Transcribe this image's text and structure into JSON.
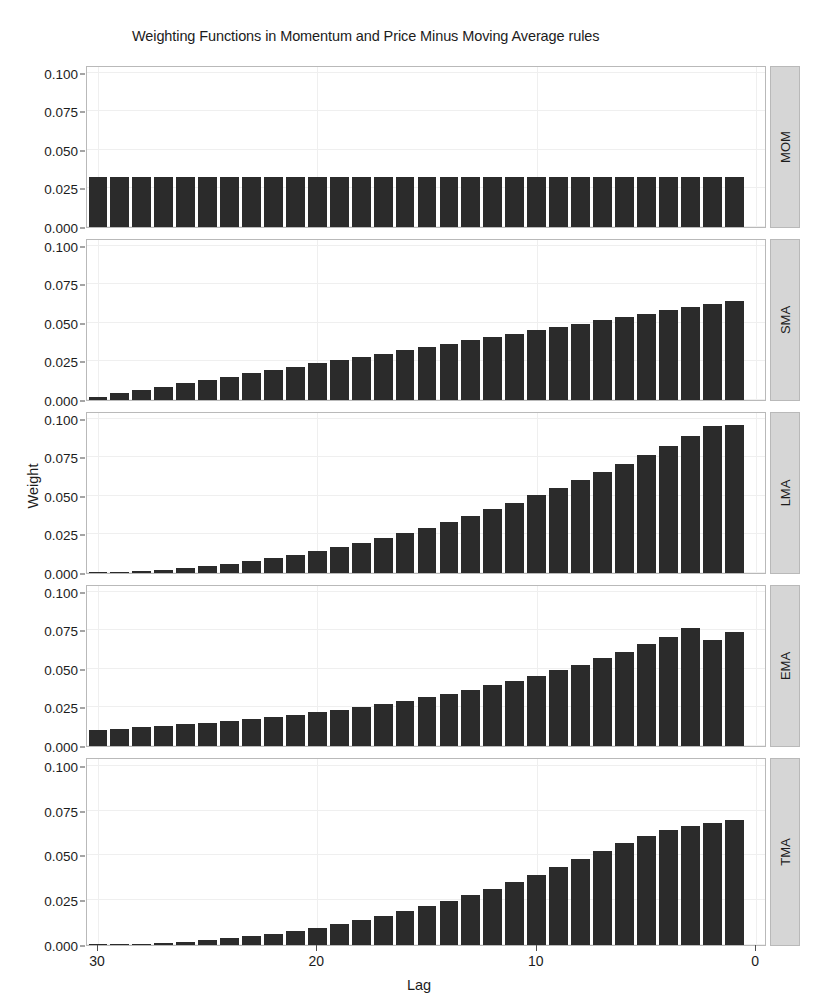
{
  "chart_data": {
    "type": "bar",
    "title": "Weighting Functions in Momentum and Price Minus Moving Average rules",
    "xlabel": "Lag",
    "ylabel": "Weight",
    "x_reversed": true,
    "xlim": [
      30.5,
      -0.5
    ],
    "ylim": [
      0.0,
      0.105
    ],
    "xticks": [
      30,
      20,
      10,
      0
    ],
    "xtick_labels": [
      "30",
      "20",
      "10",
      "0"
    ],
    "yticks": [
      0.0,
      0.025,
      0.05,
      0.075,
      0.1
    ],
    "ytick_labels": [
      "0.000",
      "0.025",
      "0.050",
      "0.075",
      "0.100"
    ],
    "grid": true,
    "legend": "none",
    "facet_position": "right",
    "bar_color": "#2b2b2b",
    "panel_background": "#ffffff",
    "strip_background": "#d6d6d6",
    "gridline_color": "#efefef",
    "lags": [
      30,
      29,
      28,
      27,
      26,
      25,
      24,
      23,
      22,
      21,
      20,
      19,
      18,
      17,
      16,
      15,
      14,
      13,
      12,
      11,
      10,
      9,
      8,
      7,
      6,
      5,
      4,
      3,
      2,
      1
    ],
    "panels": [
      {
        "label": "MOM",
        "values": [
          0.0323,
          0.0323,
          0.0323,
          0.0323,
          0.0323,
          0.0323,
          0.0323,
          0.0323,
          0.0323,
          0.0323,
          0.0323,
          0.0323,
          0.0323,
          0.0323,
          0.0323,
          0.0323,
          0.0323,
          0.0323,
          0.0323,
          0.0323,
          0.0323,
          0.0323,
          0.0323,
          0.0323,
          0.0323,
          0.0323,
          0.0323,
          0.0323,
          0.0323,
          0.0323
        ]
      },
      {
        "label": "SMA",
        "values": [
          0.0022,
          0.0043,
          0.0065,
          0.0086,
          0.0108,
          0.0129,
          0.0151,
          0.0172,
          0.0194,
          0.0215,
          0.0237,
          0.0258,
          0.028,
          0.0301,
          0.0323,
          0.0344,
          0.0366,
          0.0387,
          0.0409,
          0.043,
          0.0452,
          0.0473,
          0.0495,
          0.0516,
          0.0538,
          0.0559,
          0.0581,
          0.0602,
          0.0624,
          0.0645
        ]
      },
      {
        "label": "LMA",
        "values": [
          0.0002,
          0.0006,
          0.0013,
          0.0021,
          0.0032,
          0.0045,
          0.006,
          0.0078,
          0.0097,
          0.0119,
          0.0143,
          0.0169,
          0.0197,
          0.0228,
          0.026,
          0.0295,
          0.0332,
          0.0372,
          0.0413,
          0.0457,
          0.0503,
          0.0551,
          0.0602,
          0.0654,
          0.0709,
          0.0766,
          0.0826,
          0.0887,
          0.0951,
          0.096
        ]
      },
      {
        "label": "EMA",
        "values": [
          0.0104,
          0.0112,
          0.0121,
          0.013,
          0.014,
          0.0151,
          0.0162,
          0.0175,
          0.0188,
          0.0203,
          0.0218,
          0.0235,
          0.0253,
          0.0272,
          0.0293,
          0.0315,
          0.0339,
          0.0365,
          0.0393,
          0.0423,
          0.0455,
          0.049,
          0.0527,
          0.0568,
          0.0611,
          0.0658,
          0.0708,
          0.0762,
          0.069,
          0.074
        ]
      },
      {
        "label": "TMA",
        "values": [
          0.0002,
          0.0004,
          0.0008,
          0.0013,
          0.0019,
          0.0027,
          0.0037,
          0.0048,
          0.0062,
          0.0078,
          0.0095,
          0.0115,
          0.0137,
          0.0161,
          0.0188,
          0.0216,
          0.0247,
          0.028,
          0.0315,
          0.0353,
          0.0392,
          0.0434,
          0.0478,
          0.0524,
          0.0572,
          0.061,
          0.064,
          0.0662,
          0.068,
          0.07
        ]
      }
    ]
  }
}
